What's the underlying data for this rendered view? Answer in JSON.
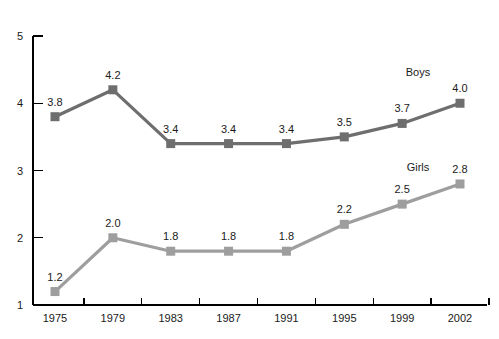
{
  "chart_data": {
    "type": "line",
    "title": "",
    "subtitle": "",
    "xlabel": "",
    "ylabel": "",
    "categories": [
      "1975",
      "1979",
      "1983",
      "1987",
      "1991",
      "1995",
      "1999",
      "2002"
    ],
    "ylim": [
      1,
      5
    ],
    "y_ticks": [
      "1",
      "2",
      "3",
      "4",
      "5"
    ],
    "grid": false,
    "legend_position": "inline-right",
    "series": [
      {
        "name": "Boys",
        "color": "#6e6e6e",
        "values": [
          3.8,
          4.2,
          3.4,
          3.4,
          3.4,
          3.5,
          3.7,
          4.0
        ],
        "labels": [
          "3.8",
          "4.2",
          "3.4",
          "3.4",
          "3.4",
          "3.5",
          "3.7",
          "4.0"
        ]
      },
      {
        "name": "Girls",
        "color": "#9e9e9e",
        "values": [
          1.2,
          2.0,
          1.8,
          1.8,
          1.8,
          2.2,
          2.5,
          2.8
        ],
        "labels": [
          "1.2",
          "2.0",
          "1.8",
          "1.8",
          "1.8",
          "2.2",
          "2.5",
          "2.8"
        ]
      }
    ],
    "annotations": [
      {
        "text": "Boys",
        "series": "Boys"
      },
      {
        "text": "Girls",
        "series": "Girls"
      }
    ],
    "axis_color": "#000000",
    "background": "#ffffff"
  }
}
